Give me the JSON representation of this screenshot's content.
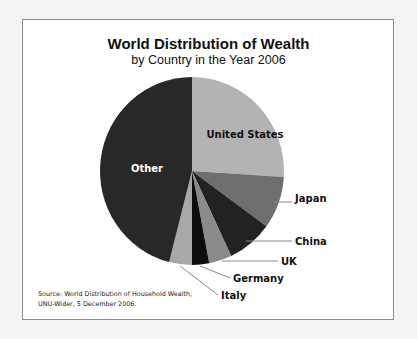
{
  "chart_data": {
    "type": "pie",
    "title": "World Distribution of Wealth",
    "subtitle": "by Country in the Year 2006",
    "start_angle": "12 o'clock",
    "direction": "clockwise",
    "slices": [
      {
        "label": "United States",
        "value": 26,
        "color": "#b3b3b3",
        "label_color": "#111111"
      },
      {
        "label": "Japan",
        "value": 9,
        "color": "#6e6e6e",
        "label_color": "#111111"
      },
      {
        "label": "China",
        "value": 8,
        "color": "#222222",
        "label_color": "#111111"
      },
      {
        "label": "UK",
        "value": 4,
        "color": "#8a8a8a",
        "label_color": "#111111"
      },
      {
        "label": "Germany",
        "value": 3,
        "color": "#0d0d0d",
        "label_color": "#111111"
      },
      {
        "label": "Italy",
        "value": 4,
        "color": "#a8a8a8",
        "label_color": "#111111"
      },
      {
        "label": "Other",
        "value": 46,
        "color": "#282828",
        "label_color": "#ffffff"
      }
    ],
    "source": [
      "Source: World Distribution of Household Wealth;",
      "UNU-Wider, 5 December 2006."
    ]
  }
}
